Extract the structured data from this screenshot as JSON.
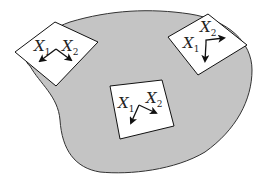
{
  "diagram": {
    "colors": {
      "region_fill": "#c4c4c4",
      "region_stroke": "#333333",
      "chart_fill": "#ffffff",
      "chart_stroke": "#111111",
      "arrow": "#111111"
    },
    "charts": [
      {
        "name": "top-left",
        "label1": "X",
        "sub1": "1",
        "label2": "X",
        "sub2": "2"
      },
      {
        "name": "top-right",
        "label1": "X",
        "sub1": "1",
        "label2": "X",
        "sub2": "2"
      },
      {
        "name": "center",
        "label1": "X",
        "sub1": "1",
        "label2": "X",
        "sub2": "2"
      }
    ]
  }
}
